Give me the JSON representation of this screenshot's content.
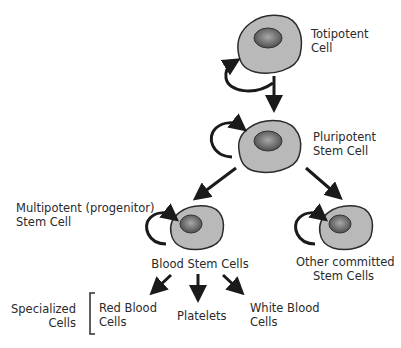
{
  "diagram": {
    "colors": {
      "cell_fill": "#b9b9b9",
      "cell_stroke": "#2b2b2b",
      "nucleus_dark": "#5a5a5a",
      "nucleus_light": "#9a9a9a",
      "arrow": "#1a1a1a",
      "text": "#2a2a2a"
    },
    "nodes": [
      {
        "id": "totipotent",
        "label_line1": "Totipotent",
        "label_line2": "Cell"
      },
      {
        "id": "pluripotent",
        "label_line1": "Pluripotent",
        "label_line2": "Stem Cell"
      },
      {
        "id": "multipotent",
        "label_line1": "Multipotent (progenitor)",
        "label_line2": "Stem Cell",
        "cell_label": "Blood Stem Cells"
      },
      {
        "id": "other",
        "label_line1": "Other committed",
        "label_line2": "Stem Cells"
      }
    ],
    "specialized": {
      "group_label_line1": "Specialized",
      "group_label_line2": "Cells",
      "items": [
        {
          "label_line1": "Red Blood",
          "label_line2": "Cells"
        },
        {
          "label_line1": "Platelets",
          "label_line2": ""
        },
        {
          "label_line1": "White Blood",
          "label_line2": "Cells"
        }
      ]
    },
    "edges": [
      {
        "from": "totipotent",
        "to": "totipotent",
        "type": "self-renewal"
      },
      {
        "from": "totipotent",
        "to": "pluripotent"
      },
      {
        "from": "pluripotent",
        "to": "pluripotent",
        "type": "self-renewal"
      },
      {
        "from": "pluripotent",
        "to": "multipotent"
      },
      {
        "from": "pluripotent",
        "to": "other"
      },
      {
        "from": "multipotent",
        "to": "multipotent",
        "type": "self-renewal"
      },
      {
        "from": "other",
        "to": "other",
        "type": "self-renewal"
      },
      {
        "from": "multipotent",
        "to": "red-blood-cells"
      },
      {
        "from": "multipotent",
        "to": "platelets"
      },
      {
        "from": "multipotent",
        "to": "white-blood-cells"
      }
    ]
  }
}
